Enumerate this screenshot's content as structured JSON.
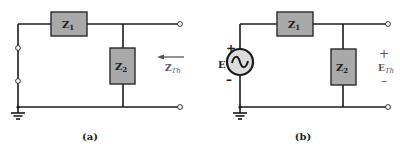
{
  "panels": [
    {
      "caption": "(a)",
      "z1": {
        "main": "Z",
        "sub": "1"
      },
      "z2": {
        "main": "Z",
        "sub": "2"
      },
      "zth": {
        "main": "Z",
        "sub": "Th"
      }
    },
    {
      "caption": "(b)",
      "z1": {
        "main": "Z",
        "sub": "1"
      },
      "z2": {
        "main": "Z",
        "sub": "2"
      },
      "source": {
        "label": "E",
        "plus": "+",
        "minus": "–"
      },
      "eth": {
        "main": "E",
        "sub": "Th",
        "plus": "+",
        "minus": "–"
      }
    }
  ],
  "colors": {
    "box_fill": "#a9a9a9",
    "wire": "#1a1a1a",
    "background": "#ffffff"
  }
}
